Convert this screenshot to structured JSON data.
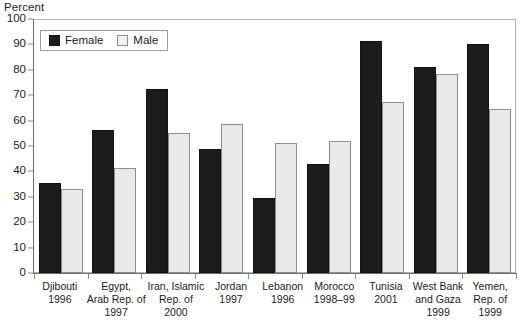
{
  "chart_data": {
    "type": "bar",
    "title": "",
    "subtitle": "",
    "xlabel": "",
    "ylabel": "Percent",
    "ylim": [
      0,
      100
    ],
    "yticks": [
      0,
      10,
      20,
      30,
      40,
      50,
      60,
      70,
      80,
      90,
      100
    ],
    "grid": false,
    "legend_position": "top-left",
    "categories": [
      "Djibouti 1996",
      "Egypt, Arab Rep. of 1997",
      "Iran, Islamic Rep. of 2000",
      "Jordan 1997",
      "Lebanon 1996",
      "Morocco 1998–99",
      "Tunisia 2001",
      "West Bank and Gaza 1999",
      "Yemen, Rep. of 1999"
    ],
    "category_lines": [
      [
        "Djibouti",
        "1996"
      ],
      [
        "Egypt,",
        "Arab Rep. of",
        "1997"
      ],
      [
        "Iran, Islamic",
        "Rep. of",
        "2000"
      ],
      [
        "Jordan",
        "1997"
      ],
      [
        "Lebanon",
        "1996"
      ],
      [
        "Morocco",
        "1998–99"
      ],
      [
        "Tunisia",
        "2001"
      ],
      [
        "West Bank",
        "and Gaza",
        "1999"
      ],
      [
        "Yemen,",
        "Rep. of",
        "1999"
      ]
    ],
    "series": [
      {
        "name": "Female",
        "color": "#1c1c1c",
        "values": [
          35.5,
          56.5,
          72.5,
          49,
          29.5,
          43,
          91.5,
          81,
          90
        ]
      },
      {
        "name": "Male",
        "color": "#e9e9e9",
        "values": [
          33,
          41.5,
          55,
          58.5,
          51,
          52,
          67.5,
          78.5,
          64.5
        ]
      }
    ]
  },
  "legend": {
    "items": [
      {
        "label": "Female",
        "key": "female"
      },
      {
        "label": "Male",
        "key": "male"
      }
    ]
  },
  "colors": {
    "female_fill": "#1c1c1c",
    "male_fill": "#e9e9e9",
    "male_border": "#8d8d8d",
    "axis": "#6e6e6e",
    "frame": "#b4b4b4",
    "text": "#1b1b1b"
  }
}
